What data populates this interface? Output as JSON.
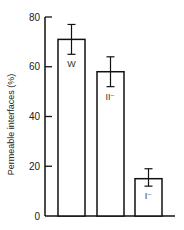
{
  "chart_data": {
    "type": "bar",
    "title": "",
    "xlabel": "",
    "ylabel": "Permeable interfaces (%)",
    "ylim": [
      0,
      80
    ],
    "yticks": [
      0,
      20,
      40,
      60,
      80
    ],
    "categories": [
      "W",
      "II⁻",
      "I⁻"
    ],
    "values": [
      71,
      58,
      15
    ],
    "error_high": [
      77,
      64,
      19
    ],
    "error_low": [
      65,
      52,
      12
    ],
    "bar_labels": [
      "W",
      "II⁻",
      "I⁻"
    ],
    "grid": false,
    "legend": null
  }
}
